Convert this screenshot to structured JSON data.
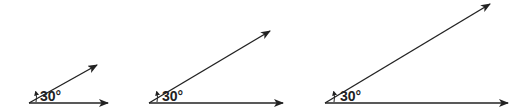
{
  "diagrams": [
    {
      "label": "30°",
      "angle_deg": 30,
      "vertex": [
        29,
        103
      ],
      "ray_tip": [
        97,
        65
      ],
      "base_tip": [
        108,
        103
      ],
      "label_pos": [
        40,
        101
      ],
      "arc_x": 36
    },
    {
      "label": "30°",
      "angle_deg": 30,
      "vertex": [
        149,
        103
      ],
      "ray_tip": [
        270,
        31
      ],
      "base_tip": [
        283,
        103
      ],
      "label_pos": [
        162,
        101
      ],
      "arc_x": 157
    },
    {
      "label": "30°",
      "angle_deg": 30,
      "vertex": [
        325,
        103
      ],
      "ray_tip": [
        490,
        4
      ],
      "base_tip": [
        508,
        103
      ],
      "label_pos": [
        340,
        101
      ],
      "arc_x": 334
    }
  ],
  "colors": {
    "line": "#222222",
    "background": "#ffffff"
  }
}
